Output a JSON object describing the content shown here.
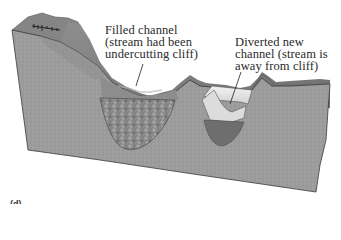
{
  "figure": {
    "type": "geologic block diagram",
    "colors": {
      "background": "#ffffff",
      "block_face": "#9a9a9a",
      "upper_layer": "#7a7a7a",
      "cliff_top": "#8c8c8c",
      "filled_channel_fill": "#8a8a8a",
      "new_channel_water": "#e6e6e6",
      "new_channel_bed": "#6c6c6c",
      "outline": "#3a3a3a"
    }
  },
  "labels": {
    "filled_channel": {
      "line1": "Filled channel",
      "line2": "(stream had been",
      "line3": "undercutting cliff)"
    },
    "diverted_channel": {
      "line1": "Diverted new",
      "line2": "channel (stream is",
      "line3": "away from cliff)"
    }
  },
  "caption": {
    "text": "(d) ..."
  }
}
